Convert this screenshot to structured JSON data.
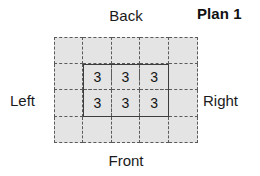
{
  "title": "Plan 1",
  "labels": {
    "back": "Back",
    "front": "Front",
    "left": "Left",
    "right": "Right"
  },
  "colors": {
    "cell_fill": "#e4e4e4",
    "dashed_line": "#5a5a5a",
    "solid_line": "#3d3d3d",
    "text": "#141414",
    "background": "#ffffff"
  },
  "diagram": {
    "type": "floor-plan-grid",
    "grid_columns": 5,
    "grid_rows": 4,
    "footprint": {
      "columns": 3,
      "rows": 2,
      "offset_column": 1,
      "offset_row": 1,
      "border_style": "solid"
    },
    "cell_values": [
      [
        "3",
        "3",
        "3"
      ],
      [
        "3",
        "3",
        "3"
      ]
    ]
  }
}
